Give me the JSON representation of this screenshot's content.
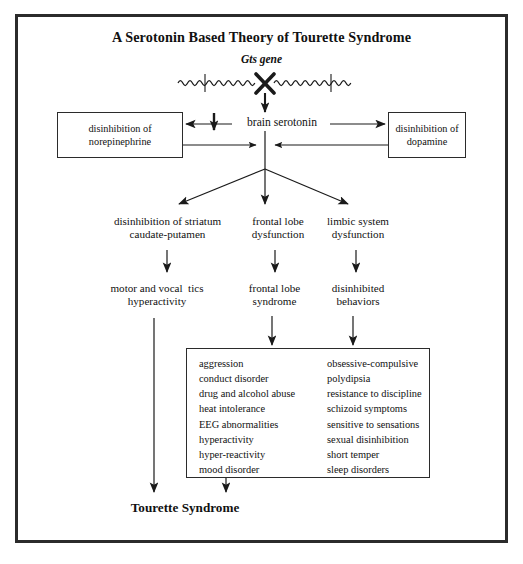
{
  "diagram": {
    "title": "A Serotonin Based Theory of Tourette Syndrome",
    "gene_label": "Gts gene",
    "central_node": "brain serotonin",
    "side_boxes": {
      "left": "disinhibition\nof norepinephrine",
      "right": "disinhibition\nof dopamine"
    },
    "level2": {
      "left": "disinhibition of striatum\ncaudate-putamen",
      "middle": "frontal lobe\ndysfunction",
      "right": "limbic system\ndysfunction"
    },
    "level3": {
      "left": "motor and vocal  tics\nhyperactivity",
      "middle": "frontal lobe\nsyndrome",
      "right": "disinhibited\nbehaviors"
    },
    "symptoms": {
      "column_left": [
        "aggression",
        "conduct disorder",
        "drug and alcohol abuse",
        "heat intolerance",
        "EEG abnormalities",
        "hyperactivity",
        "hyper-reactivity",
        "mood disorder"
      ],
      "column_right": [
        "obsessive-compulsive",
        "polydipsia",
        "resistance to discipline",
        "schizoid symptoms",
        "sensitive to sensations",
        "sexual  disinhibition",
        "short temper",
        "sleep disorders"
      ]
    },
    "outcome": "Tourette Syndrome",
    "colors": {
      "ink": "#111111",
      "frame": "#2b2b2b",
      "background": "#ffffff"
    }
  }
}
